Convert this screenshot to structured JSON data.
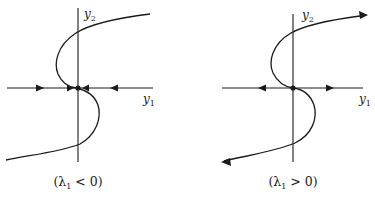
{
  "figure": {
    "panels": [
      {
        "id": "stable",
        "x_axis_label": "y",
        "x_axis_sub": "1",
        "y_axis_label": "y",
        "y_axis_sub": "2",
        "caption": "(λ₁ < 0)",
        "caption_parts": {
          "open": "(λ",
          "sub": "1",
          "rest": " < 0)"
        },
        "flow_on_y1_axis": "toward origin",
        "curve_arrows": "none"
      },
      {
        "id": "unstable",
        "x_axis_label": "y",
        "x_axis_sub": "1",
        "y_axis_label": "y",
        "y_axis_sub": "2",
        "caption": "(λ₁ > 0)",
        "caption_parts": {
          "open": "(λ",
          "sub": "1",
          "rest": " > 0)"
        },
        "flow_on_y1_axis": "away from origin",
        "curve_arrows": "outward at both ends"
      }
    ],
    "colors": {
      "ink": "#1a1a1a",
      "background": "#ffffff"
    }
  }
}
